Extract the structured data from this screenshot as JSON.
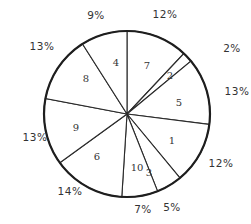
{
  "chart_data": {
    "type": "pie",
    "title": "",
    "start_angle_deg": 0,
    "direction": "clockwise",
    "center": [
      127,
      114
    ],
    "radius": 83,
    "slices": [
      {
        "label": "7",
        "value": 12,
        "pct_label": "12%"
      },
      {
        "label": "2",
        "value": 2,
        "pct_label": "2%"
      },
      {
        "label": "5",
        "value": 13,
        "pct_label": "13%"
      },
      {
        "label": "1",
        "value": 12,
        "pct_label": "12%"
      },
      {
        "label": "3",
        "value": 5,
        "pct_label": "5%"
      },
      {
        "label": "10",
        "value": 7,
        "pct_label": "7%"
      },
      {
        "label": "6",
        "value": 14,
        "pct_label": "14%"
      },
      {
        "label": "9",
        "value": 13,
        "pct_label": "13%"
      },
      {
        "label": "8",
        "value": 13,
        "pct_label": "13%"
      },
      {
        "label": "4",
        "value": 9,
        "pct_label": "9%"
      }
    ],
    "categories": [
      "7",
      "2",
      "5",
      "1",
      "3",
      "10",
      "6",
      "9",
      "8",
      "4"
    ],
    "values": [
      12,
      2,
      13,
      12,
      5,
      7,
      14,
      13,
      13,
      9
    ],
    "legend": null,
    "colors": {
      "fill": "#ffffff",
      "stroke": "#2a2a2a",
      "text": "#333333"
    }
  },
  "label_positions": {
    "inner": [
      [
        147,
        66
      ],
      [
        170,
        76
      ],
      [
        179,
        103
      ],
      [
        172,
        141
      ],
      [
        149,
        173
      ],
      [
        137,
        168
      ],
      [
        97,
        157
      ],
      [
        76,
        128
      ],
      [
        86,
        79
      ],
      [
        116,
        63
      ]
    ],
    "outer": [
      [
        165,
        15
      ],
      [
        232,
        49
      ],
      [
        237,
        92
      ],
      [
        221,
        164
      ],
      [
        172,
        208
      ],
      [
        143,
        210
      ],
      [
        70,
        192
      ],
      [
        35,
        138
      ],
      [
        42,
        47
      ],
      [
        96,
        16
      ]
    ]
  }
}
